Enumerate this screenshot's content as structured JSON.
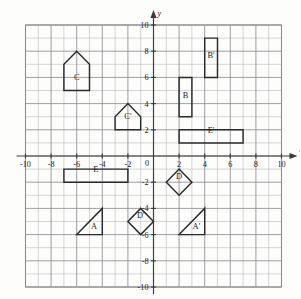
{
  "figure": {
    "type": "coordinate-grid",
    "axis_labels": {
      "x": "x",
      "y": "y"
    },
    "x_ticks": [
      "-10",
      "-8",
      "-6",
      "-4",
      "-2",
      "0",
      "2",
      "4",
      "6",
      "8",
      "10"
    ],
    "x_tick_values": [
      -10,
      -8,
      -6,
      -4,
      -2,
      0,
      2,
      4,
      6,
      8,
      10
    ],
    "y_ticks": [
      "10",
      "8",
      "6",
      "4",
      "2",
      "0",
      "-2",
      "-4",
      "-6",
      "-8",
      "-10"
    ],
    "y_tick_values": [
      10,
      8,
      6,
      4,
      2,
      0,
      -2,
      -4,
      -6,
      -8,
      -10
    ],
    "xlim": [
      -10,
      10
    ],
    "ylim": [
      -10,
      10
    ],
    "grid_step": 1,
    "colors": {
      "grid_minor": "#b9b9bd",
      "grid_major": "#8d8d93",
      "axis": "#3a3a3c",
      "shape_stroke": "#2b2b2d",
      "background": "#fdfdfc"
    },
    "shapes": [
      {
        "label": "A",
        "kind": "triangle",
        "points": [
          [
            -6,
            -6
          ],
          [
            -4,
            -6
          ],
          [
            -4,
            -4
          ]
        ],
        "label_at": [
          -4.65,
          -5.55
        ]
      },
      {
        "label": "A'",
        "kind": "triangle",
        "points": [
          [
            2,
            -6
          ],
          [
            4,
            -6
          ],
          [
            4,
            -4
          ]
        ],
        "label_at": [
          3.35,
          -5.55
        ]
      },
      {
        "label": "B",
        "kind": "rectangle",
        "points": [
          [
            2,
            3
          ],
          [
            3,
            3
          ],
          [
            3,
            6
          ],
          [
            2,
            6
          ]
        ],
        "label_at": [
          2.5,
          4.45
        ]
      },
      {
        "label": "B'",
        "kind": "rectangle",
        "points": [
          [
            4,
            6
          ],
          [
            5,
            6
          ],
          [
            5,
            9
          ],
          [
            4,
            9
          ]
        ],
        "label_at": [
          4.5,
          7.45
        ]
      },
      {
        "label": "C",
        "kind": "pentagon",
        "points": [
          [
            -7,
            5
          ],
          [
            -5,
            5
          ],
          [
            -5,
            7
          ],
          [
            -6,
            8
          ],
          [
            -7,
            7
          ]
        ],
        "label_at": [
          -6,
          5.8
        ]
      },
      {
        "label": "C'",
        "kind": "pentagon",
        "points": [
          [
            -3,
            2
          ],
          [
            -1,
            2
          ],
          [
            -1,
            3
          ],
          [
            -2,
            4
          ],
          [
            -3,
            3
          ]
        ],
        "label_at": [
          -2,
          2.8
        ]
      },
      {
        "label": "D",
        "kind": "diamond",
        "points": [
          [
            1,
            -2
          ],
          [
            2,
            -1
          ],
          [
            3,
            -2
          ],
          [
            2,
            -3
          ]
        ],
        "label_at": [
          2,
          -1.75
        ]
      },
      {
        "label": "D'",
        "kind": "diamond",
        "points": [
          [
            -2,
            -5
          ],
          [
            -1,
            -4
          ],
          [
            0,
            -5
          ],
          [
            -1,
            -6
          ]
        ],
        "label_at": [
          -1,
          -4.75
        ]
      },
      {
        "label": "E",
        "kind": "rectangle",
        "points": [
          [
            -7,
            -2
          ],
          [
            -2,
            -2
          ],
          [
            -2,
            -1
          ],
          [
            -7,
            -1
          ]
        ],
        "label_at": [
          -4.5,
          -1.25
        ]
      },
      {
        "label": "E'",
        "kind": "rectangle",
        "points": [
          [
            2,
            1
          ],
          [
            7,
            1
          ],
          [
            7,
            2
          ],
          [
            2,
            2
          ]
        ],
        "label_at": [
          4.5,
          1.75
        ]
      }
    ]
  }
}
